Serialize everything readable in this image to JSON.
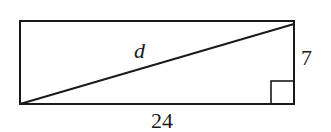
{
  "diagram": {
    "type": "rectangle-with-diagonal",
    "labels": {
      "diagonal": "d",
      "height": "7",
      "width": "24"
    },
    "right_angle_marker": "bottom-right",
    "stroke_color": "#1a1a1a"
  }
}
